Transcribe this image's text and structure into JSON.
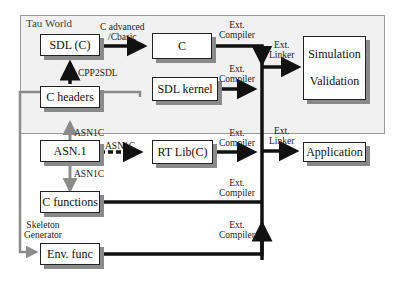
{
  "diagram": {
    "region": {
      "label": "Tau World",
      "fill": "#f1f1f1"
    },
    "nodes": {
      "sdl_c": "SDL (C)",
      "c": "C",
      "sdl_kernel": "SDL kernel",
      "sim_val": {
        "line1": "Simulation",
        "line2": "Validation"
      },
      "c_headers": "C headers",
      "asn1": "ASN.1",
      "rt_lib": "RT Lib(C)",
      "application": "Application",
      "c_functions": "C functions",
      "env_func": "Env. func"
    },
    "edge_labels": {
      "c_advanced": {
        "line1": "C advanced",
        "line2": "/Cbasic"
      },
      "cpp2sdl": "CPP2SDL",
      "asn1c_up": "ASN1C",
      "asn1c_right": "ASN1C",
      "asn1c_down": "ASN1C",
      "skeleton": {
        "line1": "Skeleton",
        "line2": "Generator"
      },
      "ext_compiler_1": {
        "line1": "Ext.",
        "line2": "Compiler"
      },
      "ext_compiler_2": {
        "line1": "Ext.",
        "line2": "Compiler"
      },
      "ext_compiler_3": {
        "line1": "Ext.",
        "line2": "Compiler"
      },
      "ext_compiler_4": {
        "line1": "Ext.",
        "line2": "Compiler"
      },
      "ext_compiler_5": {
        "line1": "Ext.",
        "line2": "Compiler"
      },
      "ext_linker_1": {
        "line1": "Ext.",
        "line2": "Linker"
      },
      "ext_linker_2": {
        "line1": "Ext.",
        "line2": "Linker"
      }
    },
    "colors": {
      "arrow_black": "#111111",
      "arrow_gray": "#8c8c8c",
      "shadow": "#8a8a8a"
    }
  }
}
